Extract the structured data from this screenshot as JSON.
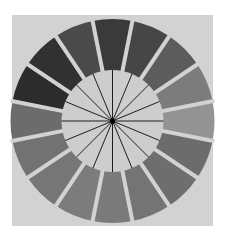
{
  "figure": {
    "title": "",
    "background_color": "#ffffff",
    "backdrop_color": "#d2d2d2",
    "center": [
      112.5,
      121
    ],
    "outer_radius": 102,
    "inner_ring_radius": 50,
    "inner_circle_radius": 51,
    "inner_circle_color": "#cdcdcd",
    "gap_color": "#d2d2d2",
    "gap_width": 4,
    "spoke_color": "#1e1e1e",
    "hub_color": "#000000",
    "segment_count": 16,
    "segments": [
      {
        "angle": 0,
        "color": "#3a3a3a"
      },
      {
        "angle": 22.5,
        "color": "#464646"
      },
      {
        "angle": 45,
        "color": "#5c5c5c"
      },
      {
        "angle": 67.5,
        "color": "#7c7c7c"
      },
      {
        "angle": 90,
        "color": "#939393"
      },
      {
        "angle": 112.5,
        "color": "#6c6c6c"
      },
      {
        "angle": 135,
        "color": "#6e6e6e"
      },
      {
        "angle": 157.5,
        "color": "#747474"
      },
      {
        "angle": 180,
        "color": "#7a7a7a"
      },
      {
        "angle": 202.5,
        "color": "#7c7c7c"
      },
      {
        "angle": 225,
        "color": "#767676"
      },
      {
        "angle": 247.5,
        "color": "#727272"
      },
      {
        "angle": 270,
        "color": "#6c6c6c"
      },
      {
        "angle": 292.5,
        "color": "#2c2c2c"
      },
      {
        "angle": 315,
        "color": "#313131"
      },
      {
        "angle": 337.5,
        "color": "#4a4a4a"
      }
    ]
  }
}
